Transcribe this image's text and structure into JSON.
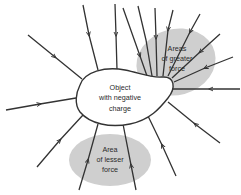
{
  "diagram": {
    "object_label": [
      "Object",
      "with negative",
      "charge"
    ],
    "greater_area_label": [
      "Areas",
      "of greater",
      "force"
    ],
    "lesser_area_label": [
      "Area",
      "of lesser",
      "force"
    ],
    "colors": {
      "area_fill": "#cfcfcf",
      "line": "#333333",
      "object_fill": "#ffffff"
    }
  }
}
